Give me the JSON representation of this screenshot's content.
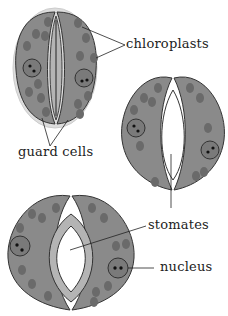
{
  "diagram": {
    "labels": {
      "chloroplasts": "chloroplasts",
      "guard_cells": "guard cells",
      "stomates": "stomates",
      "nucleus": "nucleus"
    },
    "colors": {
      "cell_fill": "#8a8a8a",
      "cell_stroke": "#333333",
      "wall_fill": "#b4b4b4",
      "chloroplast": "#6a6a6a",
      "pore": "#ffffff"
    },
    "stages": [
      "closed",
      "partially open",
      "open"
    ]
  }
}
